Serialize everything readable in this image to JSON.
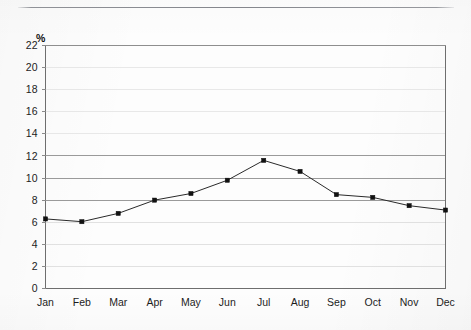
{
  "page": {
    "background_color": "#fdfdfd",
    "rule_color": "#84868c"
  },
  "chart_data": {
    "type": "line",
    "title": "",
    "subtitle": "",
    "xlabel": "",
    "ylabel": "",
    "unit_label": "%",
    "categories": [
      "Jan",
      "Feb",
      "Mar",
      "Apr",
      "May",
      "Jun",
      "Jul",
      "Aug",
      "Sep",
      "Oct",
      "Nov",
      "Dec"
    ],
    "values": [
      6.3,
      6.05,
      6.8,
      8.0,
      8.6,
      9.8,
      11.6,
      10.6,
      8.5,
      8.25,
      7.5,
      7.1
    ],
    "series": [
      {
        "name": "",
        "values": [
          6.3,
          6.05,
          6.8,
          8.0,
          8.6,
          9.8,
          11.6,
          10.6,
          8.5,
          8.25,
          7.5,
          7.1
        ]
      }
    ],
    "ylim": [
      0,
      22
    ],
    "ytick_step": 2,
    "yticks": [
      0,
      2,
      4,
      6,
      8,
      10,
      12,
      14,
      16,
      18,
      20,
      22
    ],
    "ytick_labels": [
      "0",
      "2",
      "4",
      "6",
      "8",
      "10",
      "12",
      "14",
      "16",
      "18",
      "20",
      "22"
    ],
    "grid": true,
    "grid_orientation": "horizontal",
    "legend": false,
    "legend_position": "none",
    "marker": "square",
    "marker_color": "#111111",
    "line_color": "#2a2a2a",
    "grid_color_strong": "#9a9a9a",
    "grid_color_faint": "#d8d8d8",
    "axis_color": "#8a8a8a",
    "annotations": []
  }
}
